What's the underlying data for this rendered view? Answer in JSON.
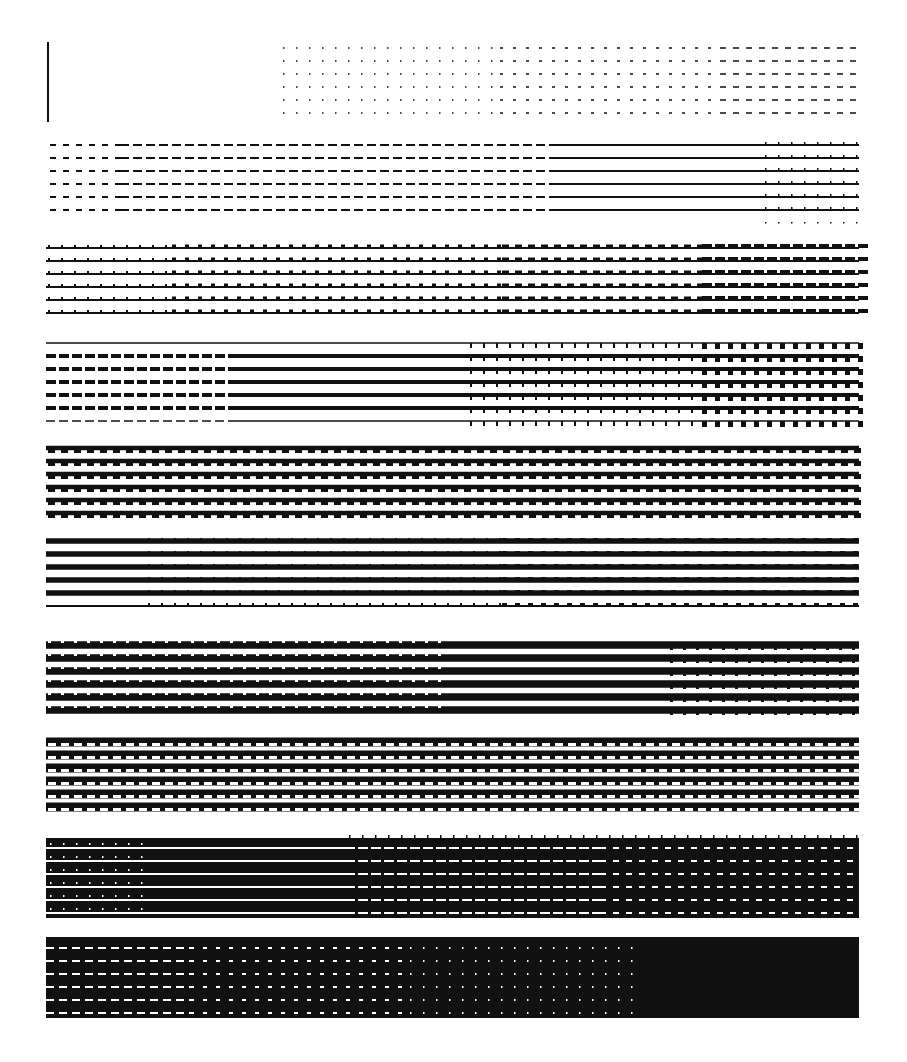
{
  "page": {
    "width": 907,
    "height": 1062,
    "background": "#ffffff",
    "ink": "#111111",
    "paper": "#ffffff"
  },
  "pattern": {
    "description": "Halftone line-dither gray ramp test pattern",
    "left": 46,
    "right": 859,
    "rows_per_band": 6,
    "line_pitch": 13,
    "vertical_marker": {
      "x": 48,
      "y1": 42,
      "y2": 122,
      "width": 2
    },
    "bands": [
      {
        "id": 1,
        "top": 48,
        "segments": [
          {
            "x1": 283,
            "x2": 500,
            "style": "dots",
            "dash": 1.5,
            "gap": 11.5,
            "weight": 1.5
          },
          {
            "x1": 500,
            "x2": 720,
            "style": "dashes",
            "dash": 3,
            "gap": 10,
            "weight": 1.6
          },
          {
            "x1": 720,
            "x2": 859,
            "style": "dashes",
            "dash": 6,
            "gap": 7,
            "weight": 1.6
          }
        ]
      },
      {
        "id": 2,
        "top": 145,
        "segments": [
          {
            "x1": 50,
            "x2": 120,
            "style": "dashes",
            "dash": 6,
            "gap": 7,
            "weight": 1.8
          },
          {
            "x1": 120,
            "x2": 558,
            "style": "dashes",
            "dash": 9,
            "gap": 4,
            "weight": 1.8
          },
          {
            "x1": 558,
            "x2": 859,
            "style": "solid",
            "weight": 1.8
          }
        ],
        "extras": [
          {
            "x1": 763,
            "x2": 859,
            "style": "ticks",
            "pitch": 13,
            "tick": 1.5,
            "height": 3,
            "rows_offset": 1
          },
          {
            "x1": 763,
            "x2": 859,
            "style": "dots-below",
            "pitch": 13
          }
        ]
      },
      {
        "id": 3,
        "top": 248,
        "segments": [
          {
            "x1": 46,
            "x2": 859,
            "style": "solid",
            "weight": 2.2
          }
        ],
        "extras": [
          {
            "x1": 46,
            "x2": 170,
            "style": "ticks",
            "pitch": 13,
            "tick": 2,
            "height": 3
          },
          {
            "x1": 170,
            "x2": 500,
            "style": "ticks",
            "pitch": 13,
            "tick": 4,
            "height": 3.5
          },
          {
            "x1": 500,
            "x2": 700,
            "style": "ticks",
            "pitch": 13,
            "tick": 7,
            "height": 3.5
          },
          {
            "x1": 700,
            "x2": 859,
            "style": "ticks",
            "pitch": 13,
            "tick": 10,
            "height": 4
          }
        ]
      },
      {
        "id": 4,
        "top": 343,
        "segments": [
          {
            "x1": 46,
            "x2": 859,
            "style": "solid",
            "weight": 2
          }
        ],
        "rows_override": [
          {
            "row": 0,
            "segments": [
              {
                "x1": 46,
                "x2": 859,
                "style": "solid",
                "weight": 1.5
              }
            ]
          },
          {
            "row": 6,
            "segments": [
              {
                "x1": 46,
                "x2": 235,
                "style": "dashes",
                "dash": 9,
                "gap": 4,
                "weight": 1.6
              },
              {
                "x1": 235,
                "x2": 859,
                "style": "solid",
                "weight": 1.6
              }
            ]
          }
        ],
        "heavy_rows": {
          "from": 1,
          "to": 5,
          "weight": 4,
          "left_dashes_until": 235,
          "dash": 10,
          "gap": 3
        },
        "extras": [
          {
            "x1": 468,
            "x2": 700,
            "style": "ticks-down",
            "pitch": 13,
            "tick": 2,
            "height": 3
          },
          {
            "x1": 700,
            "x2": 859,
            "style": "ticks-down",
            "pitch": 13,
            "tick": 5,
            "height": 4
          }
        ]
      },
      {
        "id": 5,
        "top": 448,
        "segments": [
          {
            "x1": 46,
            "x2": 859,
            "style": "solid",
            "weight": 4.5
          }
        ],
        "extras": [
          {
            "x1": 46,
            "x2": 859,
            "style": "ticks-down",
            "pitch": 13,
            "tick": 7,
            "height": 3
          }
        ]
      },
      {
        "id": 6,
        "top": 541,
        "segments": [
          {
            "x1": 46,
            "x2": 859,
            "style": "solid",
            "weight": 5.5
          }
        ],
        "extras": [
          {
            "x1": 146,
            "x2": 500,
            "style": "ticks",
            "pitch": 13,
            "tick": 2,
            "height": 3
          },
          {
            "x1": 500,
            "x2": 859,
            "style": "ticks",
            "pitch": 13,
            "tick": 5,
            "height": 3
          }
        ],
        "last_row_weight": 1.8
      },
      {
        "id": 7,
        "top": 645,
        "segments": [
          {
            "x1": 46,
            "x2": 859,
            "style": "solid",
            "weight": 7.5
          }
        ],
        "extras": [
          {
            "x1": 46,
            "x2": 440,
            "style": "gaps-top",
            "pitch": 13,
            "gap": 3
          },
          {
            "x1": 668,
            "x2": 859,
            "style": "ticks-down",
            "pitch": 13,
            "tick": 3,
            "height": 3
          }
        ]
      },
      {
        "id": 8,
        "top": 742,
        "segments": [
          {
            "x1": 46,
            "x2": 859,
            "style": "solid",
            "weight": 9
          }
        ],
        "extras": [
          {
            "x1": 46,
            "x2": 859,
            "style": "white-dashes",
            "pitch": 13,
            "dash": 8,
            "height": 3
          }
        ]
      },
      {
        "id": 9,
        "top": 840,
        "fill_block": {
          "x1": 46,
          "x2": 859,
          "y1": 838,
          "y2": 918
        },
        "white_lines": [
          {
            "x1": 46,
            "x2": 345,
            "style": "solid",
            "weight": 2
          },
          {
            "x1": 345,
            "x2": 600,
            "style": "dashes",
            "dash": 10,
            "gap": 3,
            "weight": 2
          },
          {
            "x1": 600,
            "x2": 859,
            "style": "dashes",
            "dash": 6,
            "gap": 7,
            "weight": 2
          }
        ],
        "extras": [
          {
            "x1": 46,
            "x2": 145,
            "style": "white-ticks",
            "pitch": 13
          },
          {
            "x1": 345,
            "x2": 859,
            "style": "top-ticks",
            "pitch": 13
          }
        ]
      },
      {
        "id": 10,
        "top": 940,
        "fill_block": {
          "x1": 46,
          "x2": 859,
          "y1": 937,
          "y2": 1018
        },
        "white_lines": [
          {
            "x1": 46,
            "x2": 190,
            "style": "dashes",
            "dash": 8,
            "gap": 5,
            "weight": 2.2
          },
          {
            "x1": 190,
            "x2": 410,
            "style": "dashes",
            "dash": 4,
            "gap": 9,
            "weight": 2.2
          },
          {
            "x1": 410,
            "x2": 637,
            "style": "dashes",
            "dash": 1.5,
            "gap": 11.5,
            "weight": 2
          }
        ]
      }
    ]
  }
}
